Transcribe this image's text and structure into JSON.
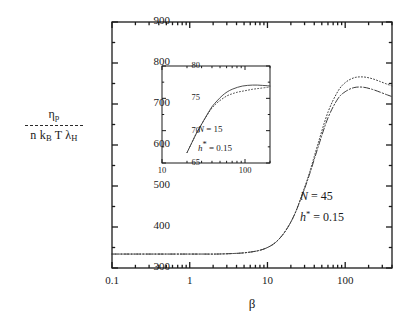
{
  "chart_data": {
    "type": "line",
    "title": "",
    "xlabel": "β",
    "ylabel_numerator": "η",
    "ylabel_numerator_sub": "p",
    "ylabel_denominator": "n k",
    "ylabel_denominator_sub1": "B",
    "ylabel_denominator_mid": " T  λ",
    "ylabel_denominator_sub2": "H",
    "xscale": "log",
    "yscale": "linear",
    "xlim": [
      0.1,
      400
    ],
    "ylim": [
      300,
      900
    ],
    "grid": false,
    "legend": "none",
    "xticks": [
      "0.1",
      "1",
      "10",
      "100"
    ],
    "xtick_values": [
      0.1,
      1,
      10,
      100
    ],
    "yticks": [
      "300",
      "400",
      "500",
      "600",
      "700",
      "800",
      "900"
    ],
    "ytick_values": [
      300,
      400,
      500,
      600,
      700,
      800,
      900
    ],
    "annotations": [
      {
        "text": "N = 45",
        "x": 60,
        "y": 470
      },
      {
        "text": "h* = 0.15",
        "x": 60,
        "y": 430
      }
    ],
    "series": [
      {
        "name": "upper-dotted",
        "style": "dotted",
        "x": [
          0.1,
          0.15,
          0.22,
          0.33,
          0.5,
          0.75,
          1,
          1.5,
          2.2,
          3.3,
          5,
          7.5,
          10,
          13,
          17,
          22,
          28,
          35,
          45,
          60,
          80,
          100,
          130,
          170,
          220,
          280,
          350,
          400
        ],
        "y": [
          334,
          334,
          334,
          334,
          334,
          334,
          334,
          334,
          334,
          335,
          337,
          342,
          350,
          364,
          390,
          428,
          480,
          535,
          605,
          680,
          730,
          752,
          764,
          766,
          762,
          755,
          748,
          744
        ]
      },
      {
        "name": "lower-dashdot",
        "style": "dashdot",
        "x": [
          0.1,
          0.15,
          0.22,
          0.33,
          0.5,
          0.75,
          1,
          1.5,
          2.2,
          3.3,
          5,
          7.5,
          10,
          13,
          17,
          22,
          28,
          35,
          45,
          60,
          80,
          100,
          130,
          170,
          220,
          280,
          350,
          400
        ],
        "y": [
          334,
          334,
          334,
          334,
          334,
          334,
          334,
          334,
          334,
          335,
          337,
          342,
          350,
          364,
          390,
          428,
          478,
          530,
          596,
          666,
          712,
          730,
          740,
          741,
          736,
          729,
          722,
          718
        ]
      }
    ]
  },
  "inset": {
    "type": "line",
    "xlabel": "",
    "ylabel": "",
    "xscale": "log",
    "yscale": "linear",
    "xlim": [
      10,
      200
    ],
    "ylim": [
      65,
      80
    ],
    "grid": false,
    "xticks": [
      "10",
      "100"
    ],
    "xtick_values": [
      10,
      100
    ],
    "yticks": [
      "65",
      "70",
      "75",
      "80"
    ],
    "ytick_values": [
      65,
      70,
      75,
      80
    ],
    "annotations": [
      {
        "text": "N = 15",
        "x": 35,
        "y": 70.2
      },
      {
        "text": "h* = 0.15",
        "x": 35,
        "y": 68.6
      }
    ],
    "series": [
      {
        "name": "inset-solid",
        "style": "solid",
        "x": [
          20,
          23,
          26,
          30,
          35,
          40,
          46,
          53,
          61,
          70,
          81,
          93,
          107,
          123,
          141,
          162,
          186,
          200
        ],
        "y": [
          66.6,
          68.2,
          69.6,
          71.0,
          72.5,
          73.7,
          74.6,
          75.4,
          76.0,
          76.4,
          76.7,
          76.9,
          77.0,
          77.05,
          77.05,
          77.0,
          76.95,
          76.9
        ]
      },
      {
        "name": "inset-dotted",
        "style": "dotted",
        "x": [
          20,
          23,
          26,
          30,
          35,
          40,
          46,
          53,
          61,
          70,
          81,
          93,
          107,
          123,
          141,
          162,
          186,
          200
        ],
        "y": [
          66.6,
          68.2,
          69.6,
          71.0,
          72.4,
          73.5,
          74.3,
          74.9,
          75.4,
          75.7,
          75.95,
          76.1,
          76.25,
          76.4,
          76.5,
          76.6,
          76.7,
          76.75
        ]
      }
    ]
  },
  "axis_labels": {
    "y_numerator": "η",
    "y_numerator_sub": "p",
    "y_den_n": "n k",
    "y_den_sub_B": "B",
    "y_den_T_lambda": " T  λ",
    "y_den_sub_H": "H",
    "x_beta": "β"
  },
  "main_annotations": {
    "N_label": "N",
    "N_eq": " = 45",
    "h_label": "h",
    "h_star": "*",
    "h_eq": " = 0.15"
  },
  "inset_annotations": {
    "N_label": "N",
    "N_eq": " = 15",
    "h_label": "h",
    "h_star": "*",
    "h_eq": " = 0.15"
  },
  "colors": {
    "axis": "#1a1a1a",
    "curve": "#3a3a3a",
    "background": "#ffffff"
  }
}
